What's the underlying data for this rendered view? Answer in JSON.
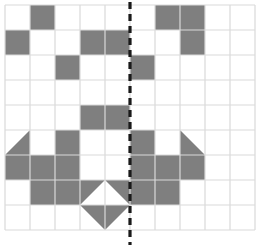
{
  "figure": {
    "title": "",
    "type": "symmetry-grid-diagram"
  },
  "grid": {
    "origin_x": 5,
    "origin_y": 5,
    "cell": 25,
    "cols": 10,
    "rows": 9,
    "line_color": "#d9d9d9",
    "line_width": 1.2,
    "background": "#ffffff"
  },
  "symmetry_line": {
    "name": "line-of-symmetry",
    "orientation": "vertical",
    "x": 130,
    "y1": 2,
    "y2": 245,
    "color": "#1a1a1a",
    "width": 3.2,
    "dash": "7 5"
  },
  "shading": {
    "fill": "#7f7f7f",
    "full_cells": [
      {
        "col": 2,
        "row": 1
      },
      {
        "col": 1,
        "row": 2
      },
      {
        "col": 4,
        "row": 2
      },
      {
        "col": 3,
        "row": 3
      },
      {
        "col": 7,
        "row": 1
      },
      {
        "col": 8,
        "row": 1
      },
      {
        "col": 5,
        "row": 2
      },
      {
        "col": 8,
        "row": 2
      },
      {
        "col": 6,
        "row": 3
      },
      {
        "col": 4,
        "row": 5
      },
      {
        "col": 5,
        "row": 5
      },
      {
        "col": 3,
        "row": 6
      },
      {
        "col": 6,
        "row": 6
      },
      {
        "col": 3,
        "row": 7
      },
      {
        "col": 6,
        "row": 7
      },
      {
        "col": 2,
        "row": 7
      },
      {
        "col": 7,
        "row": 7
      },
      {
        "col": 1,
        "row": 7
      },
      {
        "col": 8,
        "row": 7
      },
      {
        "col": 2,
        "row": 8
      },
      {
        "col": 7,
        "row": 8
      },
      {
        "col": 3,
        "row": 8
      },
      {
        "col": 6,
        "row": 8
      }
    ],
    "triangles": [
      {
        "col": 1,
        "row": 6,
        "kind": "lower-right"
      },
      {
        "col": 8,
        "row": 6,
        "kind": "lower-left"
      },
      {
        "col": 4,
        "row": 8,
        "kind": "upper-left"
      },
      {
        "col": 5,
        "row": 8,
        "kind": "upper-right"
      },
      {
        "col": 4,
        "row": 9,
        "kind": "upper-right"
      },
      {
        "col": 5,
        "row": 9,
        "kind": "upper-left"
      }
    ]
  }
}
